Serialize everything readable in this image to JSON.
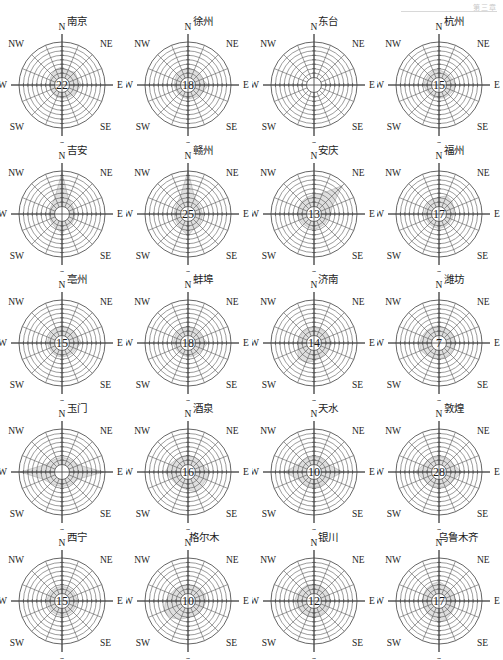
{
  "page": {
    "header_text": "第三章",
    "background": "#ffffff",
    "line_color": "#4a4a4a",
    "petal_color": "#b9b9b9",
    "text_color": "#1d1d1d"
  },
  "compass": {
    "n": "N",
    "ne": "NE",
    "e": "E",
    "se": "SE",
    "s": "S",
    "sw": "SW",
    "w": "W",
    "nw": "NW"
  },
  "chart_data": {
    "type": "wind-rose-grid",
    "title": "",
    "rings": 8,
    "spokes": 16,
    "center_label_meaning": "calm percentage",
    "directions": [
      "N",
      "NNE",
      "NE",
      "ENE",
      "E",
      "ESE",
      "SE",
      "SSE",
      "S",
      "SSW",
      "SW",
      "WSW",
      "W",
      "WNW",
      "NW",
      "NNW"
    ],
    "charts": [
      {
        "name": "南京",
        "center": "22",
        "row": 1,
        "col": 1,
        "values": [
          0.3,
          0.22,
          0.3,
          0.26,
          0.34,
          0.24,
          0.2,
          0.18,
          0.16,
          0.16,
          0.14,
          0.14,
          0.14,
          0.16,
          0.2,
          0.26
        ]
      },
      {
        "name": "徐州",
        "center": "18",
        "row": 1,
        "col": 2,
        "values": [
          0.28,
          0.24,
          0.22,
          0.22,
          0.36,
          0.26,
          0.22,
          0.18,
          0.18,
          0.16,
          0.16,
          0.16,
          0.18,
          0.18,
          0.22,
          0.24
        ]
      },
      {
        "name": "东台",
        "center": "",
        "row": 1,
        "col": 3,
        "values": [
          0.0,
          0.0,
          0.0,
          0.0,
          0.0,
          0.0,
          0.0,
          0.0,
          0.0,
          0.0,
          0.0,
          0.0,
          0.0,
          0.0,
          0.0,
          0.0
        ]
      },
      {
        "name": "杭州",
        "center": "15",
        "row": 1,
        "col": 4,
        "values": [
          0.22,
          0.18,
          0.18,
          0.2,
          0.28,
          0.22,
          0.18,
          0.18,
          0.16,
          0.16,
          0.16,
          0.18,
          0.22,
          0.2,
          0.2,
          0.22
        ]
      },
      {
        "name": "吉安",
        "center": "",
        "row": 2,
        "col": 1,
        "values": [
          0.96,
          0.26,
          0.18,
          0.16,
          0.16,
          0.16,
          0.18,
          0.2,
          0.34,
          0.22,
          0.18,
          0.16,
          0.16,
          0.16,
          0.18,
          0.3
        ]
      },
      {
        "name": "赣州",
        "center": "25",
        "row": 2,
        "col": 2,
        "values": [
          1.0,
          0.28,
          0.2,
          0.18,
          0.2,
          0.2,
          0.22,
          0.24,
          0.4,
          0.26,
          0.2,
          0.18,
          0.18,
          0.18,
          0.22,
          0.34
        ]
      },
      {
        "name": "安庆",
        "center": "13",
        "row": 2,
        "col": 3,
        "values": [
          0.34,
          0.42,
          0.92,
          0.34,
          0.26,
          0.2,
          0.2,
          0.2,
          0.22,
          0.2,
          0.2,
          0.22,
          0.26,
          0.26,
          0.28,
          0.3
        ]
      },
      {
        "name": "福州",
        "center": "17",
        "row": 2,
        "col": 4,
        "values": [
          0.26,
          0.34,
          0.3,
          0.24,
          0.2,
          0.18,
          0.18,
          0.18,
          0.2,
          0.18,
          0.18,
          0.18,
          0.2,
          0.2,
          0.22,
          0.24
        ]
      },
      {
        "name": "亳州",
        "center": "15",
        "row": 3,
        "col": 1,
        "values": [
          0.28,
          0.26,
          0.26,
          0.26,
          0.34,
          0.22,
          0.2,
          0.18,
          0.18,
          0.18,
          0.18,
          0.18,
          0.2,
          0.2,
          0.22,
          0.24
        ]
      },
      {
        "name": "蚌埠",
        "center": "18",
        "row": 3,
        "col": 2,
        "values": [
          0.26,
          0.22,
          0.22,
          0.22,
          0.34,
          0.24,
          0.2,
          0.18,
          0.18,
          0.16,
          0.16,
          0.18,
          0.2,
          0.2,
          0.22,
          0.24
        ]
      },
      {
        "name": "济南",
        "center": "14",
        "row": 3,
        "col": 3,
        "values": [
          0.24,
          0.22,
          0.22,
          0.24,
          0.3,
          0.24,
          0.22,
          0.24,
          0.3,
          0.38,
          0.42,
          0.28,
          0.24,
          0.22,
          0.22,
          0.22
        ]
      },
      {
        "name": "潍坊",
        "center": "7",
        "row": 3,
        "col": 4,
        "values": [
          0.28,
          0.24,
          0.24,
          0.24,
          0.28,
          0.22,
          0.22,
          0.22,
          0.24,
          0.24,
          0.28,
          0.34,
          0.34,
          0.3,
          0.28,
          0.28
        ]
      },
      {
        "name": "玉门",
        "center": "",
        "row": 4,
        "col": 1,
        "values": [
          0.2,
          0.2,
          0.22,
          0.3,
          0.96,
          0.3,
          0.22,
          0.2,
          0.2,
          0.2,
          0.24,
          0.34,
          0.96,
          0.32,
          0.22,
          0.2
        ]
      },
      {
        "name": "酒泉",
        "center": "16",
        "row": 4,
        "col": 2,
        "values": [
          0.26,
          0.24,
          0.24,
          0.26,
          0.42,
          0.34,
          0.34,
          0.4,
          0.3,
          0.26,
          0.26,
          0.3,
          0.44,
          0.34,
          0.28,
          0.26
        ]
      },
      {
        "name": "天水",
        "center": "10",
        "row": 4,
        "col": 3,
        "values": [
          0.22,
          0.22,
          0.22,
          0.28,
          0.6,
          0.28,
          0.22,
          0.22,
          0.22,
          0.22,
          0.24,
          0.3,
          0.62,
          0.3,
          0.24,
          0.22
        ]
      },
      {
        "name": "敦煌",
        "center": "28",
        "row": 4,
        "col": 4,
        "values": [
          0.22,
          0.22,
          0.22,
          0.26,
          0.44,
          0.28,
          0.24,
          0.22,
          0.22,
          0.22,
          0.24,
          0.28,
          0.46,
          0.28,
          0.24,
          0.22
        ]
      },
      {
        "name": "西宁",
        "center": "15",
        "row": 5,
        "col": 1,
        "values": [
          0.2,
          0.2,
          0.2,
          0.2,
          0.22,
          0.2,
          0.2,
          0.2,
          0.2,
          0.2,
          0.2,
          0.2,
          0.22,
          0.2,
          0.2,
          0.2
        ]
      },
      {
        "name": "格尔木",
        "center": "10",
        "row": 5,
        "col": 2,
        "values": [
          0.24,
          0.26,
          0.28,
          0.3,
          0.3,
          0.26,
          0.24,
          0.24,
          0.26,
          0.34,
          0.46,
          0.52,
          0.42,
          0.32,
          0.28,
          0.26
        ]
      },
      {
        "name": "银川",
        "center": "12",
        "row": 5,
        "col": 3,
        "values": [
          0.26,
          0.26,
          0.24,
          0.24,
          0.24,
          0.22,
          0.22,
          0.22,
          0.24,
          0.24,
          0.26,
          0.3,
          0.34,
          0.3,
          0.28,
          0.28
        ]
      },
      {
        "name": "乌鲁木齐",
        "center": "17",
        "row": 5,
        "col": 4,
        "values": [
          0.34,
          0.26,
          0.24,
          0.24,
          0.26,
          0.26,
          0.28,
          0.34,
          0.4,
          0.3,
          0.26,
          0.24,
          0.26,
          0.26,
          0.28,
          0.3
        ]
      }
    ]
  }
}
